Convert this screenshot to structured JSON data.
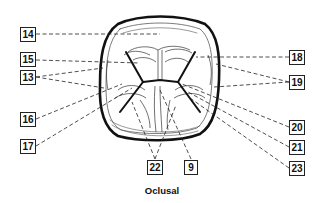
{
  "figure": {
    "caption": "Oclusal",
    "line_color": "#111111",
    "label_border_color": "#222222"
  },
  "labels": {
    "left": [
      {
        "id": "14",
        "text": "14"
      },
      {
        "id": "15",
        "text": "15"
      },
      {
        "id": "13",
        "text": "13"
      },
      {
        "id": "16",
        "text": "16"
      },
      {
        "id": "17",
        "text": "17"
      }
    ],
    "right": [
      {
        "id": "18",
        "text": "18"
      },
      {
        "id": "19",
        "text": "19"
      },
      {
        "id": "20",
        "text": "20"
      },
      {
        "id": "21",
        "text": "21"
      },
      {
        "id": "23",
        "text": "23"
      }
    ],
    "bottom": [
      {
        "id": "22",
        "text": "22"
      },
      {
        "id": "9",
        "text": "9"
      }
    ]
  }
}
